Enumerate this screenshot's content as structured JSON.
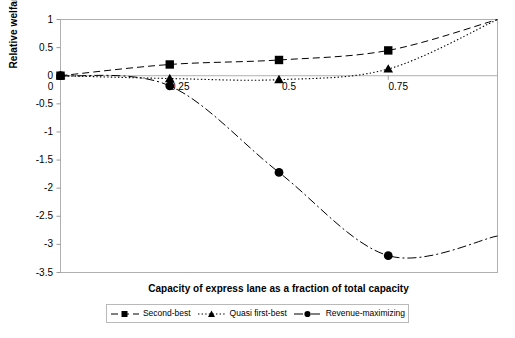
{
  "chart_data": {
    "type": "line",
    "title": "",
    "xlabel": "Capacity of express lane as a fraction of total capacity",
    "ylabel": "Relative welfare gain",
    "xlim": [
      0,
      1
    ],
    "ylim": [
      -3.5,
      1
    ],
    "grid": false,
    "legend_position": "bottom",
    "xticks": [
      0,
      0.25,
      0.5,
      0.75
    ],
    "xtick_labels": [
      "0",
      "0.25",
      "0.5",
      "0.75"
    ],
    "yticks": [
      1,
      0.5,
      0,
      -0.5,
      -1,
      -1.5,
      -2,
      -2.5,
      -3,
      -3.5
    ],
    "ytick_labels": [
      "1",
      "0.5",
      "0",
      "-0.5",
      "-1",
      "-1.5",
      "-2",
      "-2.5",
      "-3",
      "-3.5"
    ],
    "series": [
      {
        "name": "Second-best",
        "marker": "square",
        "line_style": "dashed",
        "color": "#000000",
        "x": [
          0,
          0.25,
          0.5,
          0.75,
          1
        ],
        "values": [
          0,
          0.2,
          0.28,
          0.45,
          1.0
        ],
        "marker_x": [
          0,
          0.25,
          0.5,
          0.75
        ],
        "marker_values": [
          0,
          0.2,
          0.28,
          0.45
        ]
      },
      {
        "name": "Quasi first-best",
        "marker": "triangle",
        "line_style": "dotted",
        "color": "#000000",
        "x": [
          0,
          0.25,
          0.5,
          0.75,
          1
        ],
        "values": [
          0,
          -0.05,
          -0.07,
          0.12,
          1.0
        ],
        "marker_x": [
          0,
          0.25,
          0.5,
          0.75
        ],
        "marker_values": [
          0,
          -0.05,
          -0.07,
          0.12
        ]
      },
      {
        "name": "Revenue-maximizing",
        "marker": "circle",
        "line_style": "dash-dot",
        "color": "#000000",
        "x": [
          0,
          0.25,
          0.5,
          0.75,
          1
        ],
        "values": [
          0,
          -0.18,
          -1.72,
          -3.2,
          -2.85
        ],
        "marker_x": [
          0,
          0.25,
          0.5,
          0.75
        ],
        "marker_values": [
          0,
          -0.18,
          -1.72,
          -3.2
        ]
      }
    ]
  },
  "legend": {
    "items": [
      {
        "label": "Second-best",
        "marker": "square-marker"
      },
      {
        "label": "Quasi first-best",
        "marker": "triangle-marker"
      },
      {
        "label": "Revenue-maximizing",
        "marker": "circle-marker"
      }
    ]
  },
  "caption": {
    "text": ""
  }
}
